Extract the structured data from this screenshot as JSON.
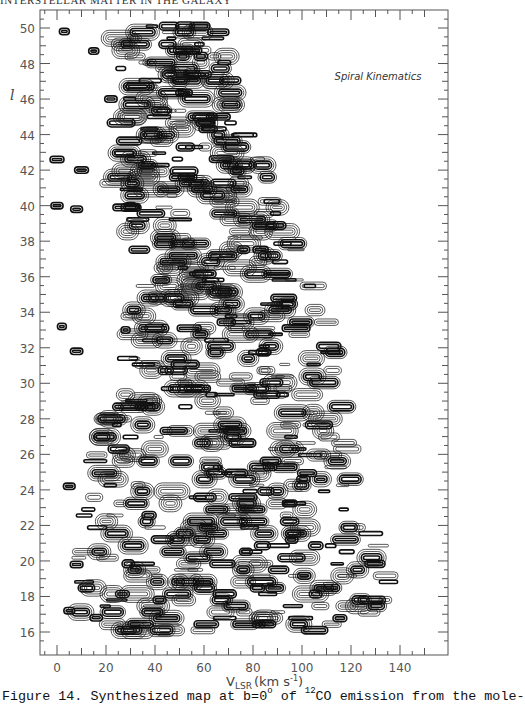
{
  "header": {
    "running_head": "INTERSTELLAR MATTER IN THE GALAXY"
  },
  "chart_data": {
    "type": "contour",
    "title": "Spiral Kinematics",
    "xlabel": "V_LSR (km s^-1)",
    "ylabel": "l",
    "xlim": [
      -8,
      152
    ],
    "ylim": [
      15.3,
      50.8
    ],
    "x_ticks": [
      0,
      20,
      40,
      60,
      80,
      100,
      120,
      140
    ],
    "y_ticks": [
      16,
      18,
      20,
      22,
      24,
      26,
      28,
      30,
      32,
      34,
      36,
      38,
      40,
      42,
      44,
      46,
      48,
      50
    ],
    "envelope": [
      {
        "l": 50,
        "vmin": 22,
        "vmax": 68
      },
      {
        "l": 46,
        "vmin": 28,
        "vmax": 74
      },
      {
        "l": 42,
        "vmin": 20,
        "vmax": 85
      },
      {
        "l": 38,
        "vmin": 30,
        "vmax": 96
      },
      {
        "l": 34,
        "vmin": 30,
        "vmax": 110
      },
      {
        "l": 30,
        "vmin": 22,
        "vmax": 118
      },
      {
        "l": 26,
        "vmin": 16,
        "vmax": 122
      },
      {
        "l": 22,
        "vmin": 10,
        "vmax": 128
      },
      {
        "l": 18,
        "vmin": 6,
        "vmax": 140
      },
      {
        "l": 16,
        "vmin": 12,
        "vmax": 112
      }
    ],
    "isolated_features": [
      {
        "v": 3,
        "l": 49.8
      },
      {
        "v": 15,
        "l": 48.7
      },
      {
        "v": 22,
        "l": 46.0
      },
      {
        "v": 0,
        "l": 42.6
      },
      {
        "v": 10,
        "l": 42.0
      },
      {
        "v": 0,
        "l": 40.0
      },
      {
        "v": 8,
        "l": 39.8
      },
      {
        "v": 30,
        "l": 40.0
      },
      {
        "v": 2,
        "l": 33.2
      },
      {
        "v": 28,
        "l": 33.0
      },
      {
        "v": 8,
        "l": 31.8
      },
      {
        "v": 5,
        "l": 24.2
      },
      {
        "v": 8,
        "l": 19.8
      },
      {
        "v": 5,
        "l": 17.2
      },
      {
        "v": 16,
        "l": 16.8
      }
    ],
    "series_note": "12CO emission, b=0 deg"
  },
  "axes": {
    "x_tick_labels": [
      "0",
      "20",
      "40",
      "60",
      "80",
      "100",
      "120",
      "140"
    ],
    "y_tick_labels": [
      "16",
      "18",
      "20",
      "22",
      "24",
      "26",
      "28",
      "30",
      "32",
      "34",
      "36",
      "38",
      "40",
      "42",
      "44",
      "46",
      "48",
      "50"
    ],
    "xlabel_main": "V",
    "xlabel_sub": "LSR",
    "xlabel_units": "(km s",
    "xlabel_exp": "-1",
    "xlabel_close": ")",
    "ylabel": "l",
    "annotation": "Spiral Kinematics"
  },
  "caption": {
    "prefix": "Figure 14.  Synthesized map at b=0",
    "deg": "o",
    "mid": " of ",
    "iso": "12",
    "suffix": "CO emission from the mole-"
  }
}
